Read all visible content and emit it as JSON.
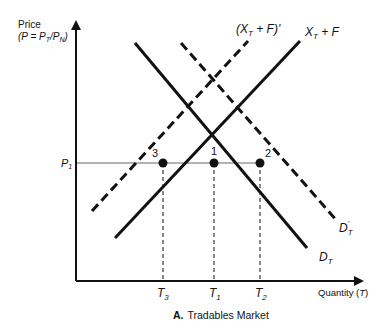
{
  "diagram": {
    "title_letter": "A.",
    "title": "Tradables Market",
    "y_axis": {
      "label_line1": "Price",
      "label_line2": "(P = P",
      "label_sub_T": "T",
      "label_slash": "/P",
      "label_sub_N": "N",
      "label_close": ")"
    },
    "x_axis": {
      "label": "Quantity (",
      "label_var": "T",
      "label_close": ")"
    },
    "price_level": {
      "label": "P",
      "sub": "1"
    },
    "quantity_ticks": [
      {
        "label": "T",
        "sub": "3"
      },
      {
        "label": "T",
        "sub": "1"
      },
      {
        "label": "T",
        "sub": "2"
      }
    ],
    "curves": {
      "supply": {
        "label": "X",
        "sub": "T",
        "suffix": " + F",
        "style": "solid"
      },
      "supply_shifted": {
        "label": "(X",
        "sub": "T",
        "suffix": " + F)'",
        "style": "dashed"
      },
      "demand": {
        "label": "D",
        "sub": "T",
        "style": "solid"
      },
      "demand_shifted": {
        "label": "D",
        "sub": "T",
        "prime": "'",
        "style": "dashed"
      }
    },
    "points": [
      {
        "label": "3"
      },
      {
        "label": "1"
      },
      {
        "label": "2"
      }
    ],
    "colors": {
      "ink": "#111111",
      "price_line": "#9a9a9a"
    }
  }
}
